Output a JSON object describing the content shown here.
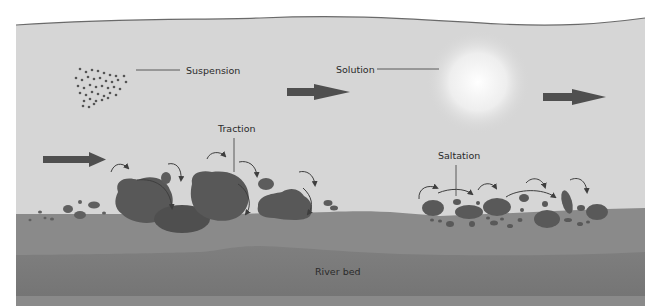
{
  "diagram": {
    "labels": {
      "suspension": "Suspension",
      "solution": "Solution",
      "traction": "Traction",
      "saltation": "Saltation",
      "river_bed": "River bed"
    },
    "colors": {
      "water": "#d6d6d6",
      "water_surface_line": "#6a6a6a",
      "sediment_layer": "#8a8a8a",
      "bed_layer": "#7b7b7b",
      "rock": "#555555",
      "arrow": "#4f4f4f",
      "leader_line": "#3a3a3a"
    },
    "flow_arrows": 3
  }
}
